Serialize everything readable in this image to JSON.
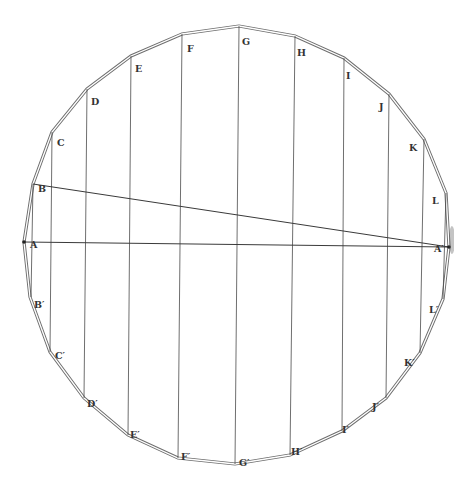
{
  "figure": {
    "type": "inscribed-polygon construction",
    "line_color": "#4a4a4a",
    "outline_color": "#6e6e6e",
    "background": "#ffffff"
  },
  "vertices": [
    {
      "id": "A",
      "label": "A",
      "x": 24,
      "y": 242,
      "lx": 30,
      "ly": 240
    },
    {
      "id": "B",
      "label": "B",
      "x": 33,
      "y": 184,
      "lx": 38,
      "ly": 184
    },
    {
      "id": "C",
      "label": "C",
      "x": 52,
      "y": 132,
      "lx": 57,
      "ly": 138
    },
    {
      "id": "D",
      "label": "D",
      "x": 87,
      "y": 89,
      "lx": 91,
      "ly": 97
    },
    {
      "id": "E",
      "label": "E",
      "x": 131,
      "y": 56,
      "lx": 135,
      "ly": 64
    },
    {
      "id": "F",
      "label": "F",
      "x": 182,
      "y": 34,
      "lx": 187,
      "ly": 44
    },
    {
      "id": "G",
      "label": "G",
      "x": 239,
      "y": 26,
      "lx": 242,
      "ly": 37
    },
    {
      "id": "H",
      "label": "H",
      "x": 295,
      "y": 36,
      "lx": 297,
      "ly": 48
    },
    {
      "id": "I",
      "label": "I",
      "x": 344,
      "y": 58,
      "lx": 346,
      "ly": 71
    },
    {
      "id": "J",
      "label": "J",
      "x": 389,
      "y": 94,
      "lx": 379,
      "ly": 102
    },
    {
      "id": "K",
      "label": "K",
      "x": 424,
      "y": 139,
      "lx": 409,
      "ly": 143
    },
    {
      "id": "L",
      "label": "L",
      "x": 446,
      "y": 193,
      "lx": 432,
      "ly": 196
    },
    {
      "id": "A2",
      "label": "A′",
      "x": 449,
      "y": 247,
      "lx": 434,
      "ly": 244
    },
    {
      "id": "L2",
      "label": "L′",
      "x": 443,
      "y": 299,
      "lx": 429,
      "ly": 305
    },
    {
      "id": "K2",
      "label": "K′",
      "x": 420,
      "y": 353,
      "lx": 404,
      "ly": 358
    },
    {
      "id": "J2",
      "label": "J′",
      "x": 386,
      "y": 398,
      "lx": 372,
      "ly": 402
    },
    {
      "id": "I2",
      "label": "I′",
      "x": 342,
      "y": 431,
      "lx": 342,
      "ly": 425
    },
    {
      "id": "H2",
      "label": "H′",
      "x": 290,
      "y": 455,
      "lx": 291,
      "ly": 447
    },
    {
      "id": "G2",
      "label": "G′",
      "x": 235,
      "y": 464,
      "lx": 239,
      "ly": 458
    },
    {
      "id": "F2",
      "label": "F′",
      "x": 178,
      "y": 458,
      "lx": 181,
      "ly": 452
    },
    {
      "id": "E2",
      "label": "E′",
      "x": 128,
      "y": 435,
      "lx": 130,
      "ly": 430
    },
    {
      "id": "D2",
      "label": "D′",
      "x": 84,
      "y": 398,
      "lx": 87,
      "ly": 399
    },
    {
      "id": "C2",
      "label": "C′",
      "x": 50,
      "y": 352,
      "lx": 55,
      "ly": 351
    },
    {
      "id": "B2",
      "label": "B′",
      "x": 30,
      "y": 297,
      "lx": 34,
      "ly": 300
    }
  ],
  "vertical_chords": [
    {
      "name": "B-B′",
      "x1": 33,
      "y1": 184,
      "x2": 31,
      "y2": 297
    },
    {
      "name": "C-C′",
      "x1": 52,
      "y1": 132,
      "x2": 50,
      "y2": 352
    },
    {
      "name": "D-D′",
      "x1": 87,
      "y1": 89,
      "x2": 84,
      "y2": 398
    },
    {
      "name": "E-E′",
      "x1": 131,
      "y1": 56,
      "x2": 128,
      "y2": 435
    },
    {
      "name": "F-F′",
      "x1": 182,
      "y1": 34,
      "x2": 178,
      "y2": 458
    },
    {
      "name": "G-G′",
      "x1": 239,
      "y1": 26,
      "x2": 235,
      "y2": 464
    },
    {
      "name": "H-H′",
      "x1": 295,
      "y1": 36,
      "x2": 290,
      "y2": 455
    },
    {
      "name": "I-I′",
      "x1": 344,
      "y1": 58,
      "x2": 342,
      "y2": 431
    },
    {
      "name": "J-J′",
      "x1": 389,
      "y1": 94,
      "x2": 386,
      "y2": 398
    },
    {
      "name": "K-K′",
      "x1": 424,
      "y1": 139,
      "x2": 420,
      "y2": 353
    },
    {
      "name": "L-L′",
      "x1": 446,
      "y1": 193,
      "x2": 443,
      "y2": 299
    }
  ],
  "diagonals": [
    {
      "name": "A-A′",
      "x1": 24,
      "y1": 242,
      "x2": 449,
      "y2": 247
    },
    {
      "name": "B-A′",
      "x1": 33,
      "y1": 184,
      "x2": 449,
      "y2": 247
    }
  ]
}
